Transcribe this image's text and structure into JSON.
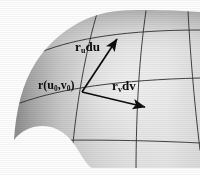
{
  "figure": {
    "background_color": "#ffffff",
    "surface_color_light": "#e9e9e9",
    "surface_color_mid": "#cfcfcf",
    "surface_color_dark": "#8a8a8a",
    "grid_color": "#2b2b2b",
    "vector_color": "#0d0d0d"
  },
  "labels": {
    "r_u_du": {
      "vector": "r",
      "subscript": "u",
      "differential": "du"
    },
    "r_point": {
      "vector": "r",
      "open": "(",
      "arg1": "u",
      "sub1": "0",
      "comma": ",",
      "arg2": "v",
      "sub2": "0",
      "close": ")"
    },
    "r_v_dv": {
      "vector": "r",
      "subscript": "v",
      "differential": "dv"
    }
  },
  "vectors": [
    {
      "name": "r_u du",
      "from": [
        82,
        92
      ],
      "to": [
        118,
        38
      ],
      "arrowhead": "filled"
    },
    {
      "name": "r_v dv",
      "from": [
        82,
        92
      ],
      "to": [
        146,
        108
      ],
      "arrowhead": "filled"
    }
  ],
  "base_point": {
    "name": "r(u0,v0)",
    "x": 82,
    "y": 92
  }
}
